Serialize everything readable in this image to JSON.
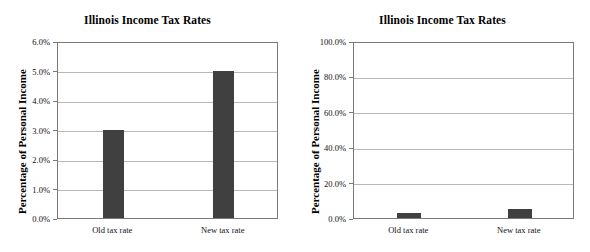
{
  "figure": {
    "background_color": "#ffffff",
    "bar_color": "#404040",
    "gridline_color": "#b8b8b8",
    "axis_color": "#7a7a7a"
  },
  "chart_data": [
    {
      "type": "bar",
      "panel": "left",
      "title": "Illinois Income Tax Rates",
      "xlabel": "",
      "ylabel": "Percentage of Personal Income",
      "categories": [
        "Old tax rate",
        "New tax rate"
      ],
      "values": [
        3.0,
        5.0
      ],
      "ylim": [
        0.0,
        6.0
      ],
      "ytick_values": [
        0.0,
        1.0,
        2.0,
        3.0,
        4.0,
        5.0,
        6.0
      ],
      "ytick_labels": [
        "0.0%",
        "1.0%",
        "2.0%",
        "3.0%",
        "4.0%",
        "5.0%",
        "6.0%"
      ],
      "grid": true,
      "legend": "none"
    },
    {
      "type": "bar",
      "panel": "right",
      "title": "Illinois Income Tax Rates",
      "xlabel": "",
      "ylabel": "Percentage of Personal Income",
      "categories": [
        "Old tax rate",
        "New tax rate"
      ],
      "values": [
        3.0,
        5.0
      ],
      "ylim": [
        0.0,
        100.0
      ],
      "ytick_values": [
        0.0,
        20.0,
        40.0,
        60.0,
        80.0,
        100.0
      ],
      "ytick_labels": [
        "0.0%",
        "20.0%",
        "40.0%",
        "60.0%",
        "80.0%",
        "100.0%"
      ],
      "grid": true,
      "legend": "none"
    }
  ]
}
